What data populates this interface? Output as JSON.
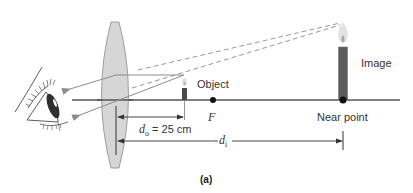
{
  "figure": {
    "caption": "(a)",
    "labels": {
      "object": "Object",
      "focal_point": "F",
      "image": "Image",
      "near_point": "Near point",
      "do_symbol": "d",
      "do_subscript": "o",
      "do_value": " = 25 cm",
      "di_symbol": "d",
      "di_subscript": "i"
    },
    "colors": {
      "lens_fill": "#d6d6d6",
      "lens_stroke": "#8a8a8a",
      "axis": "#555555",
      "ray": "#8c8c8c",
      "candle_body": "#5c5c5c",
      "flame": "#dcdcdc",
      "dot": "#111111"
    },
    "elements": [
      "eye",
      "converging-lens",
      "optical-axis",
      "object-candle",
      "focal-point",
      "image-candle",
      "near-point",
      "distance-do",
      "distance-di"
    ]
  }
}
